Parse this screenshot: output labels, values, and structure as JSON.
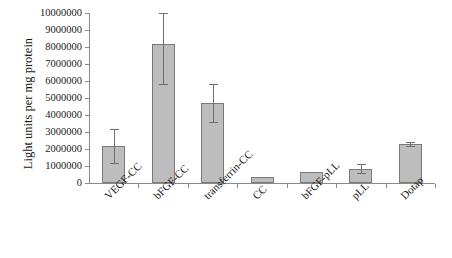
{
  "chart_data": {
    "type": "bar",
    "title": "",
    "xlabel": "",
    "ylabel": "Light units per mg protein",
    "ylim": [
      0,
      10000000
    ],
    "ytick_step": 1000000,
    "grid": false,
    "legend": "none",
    "bar_color": "#bdbdbd",
    "bar_edge_color": "#7a7a7a",
    "categories": [
      "VEGF-CC",
      "bFGF-CC",
      "transferrin-CC",
      "CC",
      "bFGF-pLL",
      "pLL",
      "Dotap"
    ],
    "values": [
      2200000,
      8200000,
      4700000,
      360000,
      650000,
      840000,
      2280000
    ],
    "errors": [
      1000000,
      2400000,
      1100000,
      0,
      0,
      260000,
      120000
    ],
    "ytick_labels": [
      "10000000",
      "9000000",
      "8000000",
      "7000000",
      "6000000",
      "5000000",
      "4000000",
      "3000000",
      "2000000",
      "1000000",
      "0"
    ]
  }
}
